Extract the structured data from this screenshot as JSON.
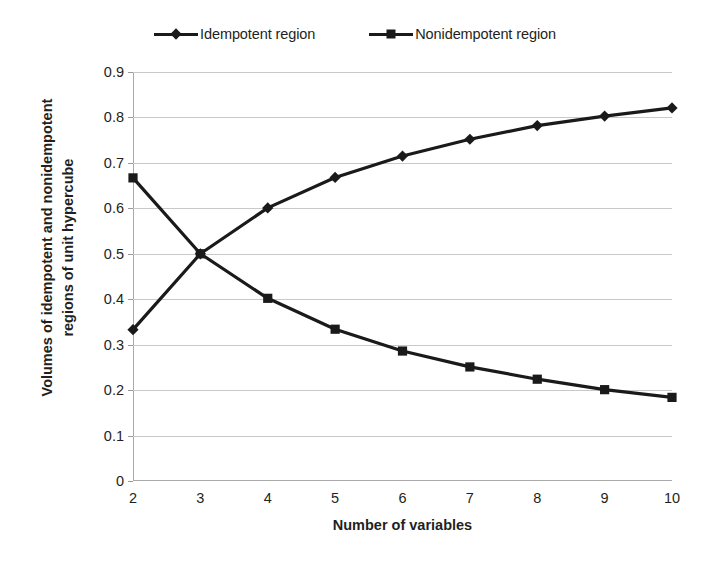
{
  "chart_data": {
    "type": "line",
    "title": "",
    "xlabel": "Number of variables",
    "ylabel": "Volumes of idempotent and nonidempotent regions of unit hypercube",
    "ylabel_line1": "Volumes of idempotent and nonidempotent",
    "ylabel_line2": "regions of unit hypercube",
    "categories": [
      2,
      3,
      4,
      5,
      6,
      7,
      8,
      9,
      10
    ],
    "x": [
      2,
      3,
      4,
      5,
      6,
      7,
      8,
      9,
      10
    ],
    "xtick_labels": [
      "2",
      "3",
      "4",
      "5",
      "6",
      "7",
      "8",
      "9",
      "10"
    ],
    "ytick_labels": [
      "0",
      "0.1",
      "0.2",
      "0.3",
      "0.4",
      "0.5",
      "0.6",
      "0.7",
      "0.8",
      "0.9"
    ],
    "ytick_values": [
      0,
      0.1,
      0.2,
      0.3,
      0.4,
      0.5,
      0.6,
      0.7,
      0.8,
      0.9
    ],
    "xlim": [
      2,
      10
    ],
    "ylim": [
      0,
      0.9
    ],
    "grid": "horizontal",
    "legend_position": "top-center",
    "series": [
      {
        "name": "Idempotent region",
        "marker": "diamond",
        "color": "#1a1a1a",
        "values": [
          0.333,
          0.5,
          0.601,
          0.668,
          0.715,
          0.752,
          0.782,
          0.803,
          0.821
        ]
      },
      {
        "name": "Nonidempotent region",
        "marker": "square",
        "color": "#1a1a1a",
        "values": [
          0.667,
          0.5,
          0.402,
          0.334,
          0.286,
          0.251,
          0.224,
          0.201,
          0.184
        ]
      }
    ]
  },
  "legend": {
    "items": [
      {
        "label": "Idempotent region",
        "marker": "diamond"
      },
      {
        "label": "Nonidempotent region",
        "marker": "square"
      }
    ]
  },
  "axes": {
    "x_title": "Number of variables",
    "y_title_line1": "Volumes of idempotent and nonidempotent",
    "y_title_line2": "regions of unit hypercube"
  }
}
